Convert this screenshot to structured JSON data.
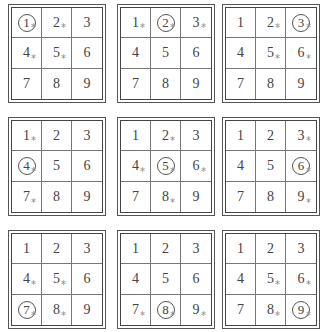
{
  "figure": {
    "star_symbol": "*",
    "grids": [
      {
        "circled": 1,
        "starred": [
          1,
          2,
          4,
          5
        ],
        "cells": [
          "1",
          "2",
          "3",
          "4",
          "5",
          "6",
          "7",
          "8",
          "9"
        ]
      },
      {
        "circled": 2,
        "starred": [
          1,
          2,
          3
        ],
        "cells": [
          "1",
          "2",
          "3",
          "4",
          "5",
          "6",
          "7",
          "8",
          "9"
        ]
      },
      {
        "circled": 3,
        "starred": [
          2,
          3,
          5,
          6
        ],
        "cells": [
          "1",
          "2",
          "3",
          "4",
          "5",
          "6",
          "7",
          "8",
          "9"
        ]
      },
      {
        "circled": 4,
        "starred": [
          1,
          4,
          7
        ],
        "cells": [
          "1",
          "2",
          "3",
          "4",
          "5",
          "6",
          "7",
          "8",
          "9"
        ]
      },
      {
        "circled": 5,
        "starred": [
          2,
          4,
          5,
          6,
          8
        ],
        "cells": [
          "1",
          "2",
          "3",
          "4",
          "5",
          "6",
          "7",
          "8",
          "9"
        ]
      },
      {
        "circled": 6,
        "starred": [
          3,
          6,
          9
        ],
        "cells": [
          "1",
          "2",
          "3",
          "4",
          "5",
          "6",
          "7",
          "8",
          "9"
        ]
      },
      {
        "circled": 7,
        "starred": [
          4,
          5,
          7,
          8
        ],
        "cells": [
          "1",
          "2",
          "3",
          "4",
          "5",
          "6",
          "7",
          "8",
          "9"
        ]
      },
      {
        "circled": 8,
        "starred": [
          7,
          8,
          9
        ],
        "cells": [
          "1",
          "2",
          "3",
          "4",
          "5",
          "6",
          "7",
          "8",
          "9"
        ]
      },
      {
        "circled": 9,
        "starred": [
          5,
          6,
          8,
          9
        ],
        "cells": [
          "1",
          "2",
          "3",
          "4",
          "5",
          "6",
          "7",
          "8",
          "9"
        ]
      }
    ]
  },
  "colors": {
    "border": "#444444",
    "divider": "#777777",
    "text": "#444444",
    "star": "#888888"
  }
}
